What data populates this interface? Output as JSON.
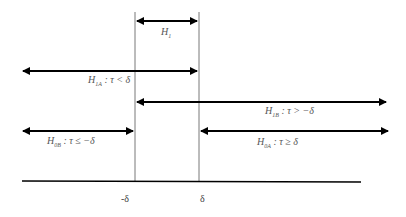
{
  "diagram": {
    "type": "interval-hypotheses",
    "labels": {
      "h1": {
        "sym": "H",
        "sub": "1",
        "cond": ""
      },
      "h1a": {
        "sym": "H",
        "sub": "1A",
        "cond": " : τ < δ"
      },
      "h1b": {
        "sym": "H",
        "sub": "1B",
        "cond": " : τ > −δ"
      },
      "h0b": {
        "sym": "H",
        "sub": "0B",
        "cond": " : τ ≤ −δ"
      },
      "h0a": {
        "sym": "H",
        "sub": "0A",
        "cond": " : τ ≥ δ"
      }
    },
    "axis": {
      "ticks": [
        "-δ",
        "δ"
      ]
    },
    "colors": {
      "line": "#000000",
      "text": "#555555"
    }
  }
}
